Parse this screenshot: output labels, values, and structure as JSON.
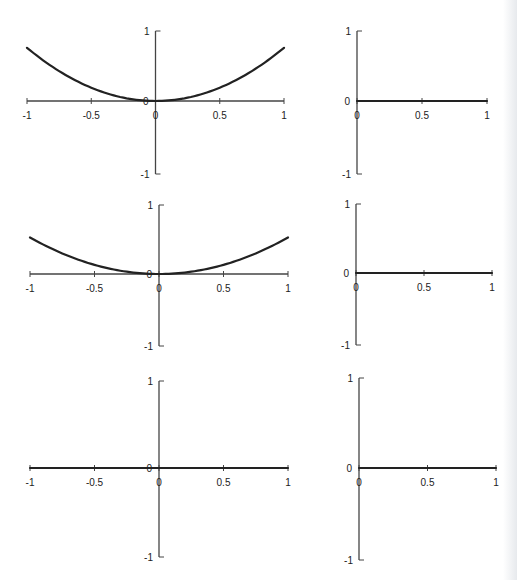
{
  "figure": {
    "layout": "3 rows x 2 columns of small function plots",
    "line_color": "#222222",
    "axis_color": "#444444"
  },
  "chart_data": [
    {
      "type": "line",
      "id": "row1-left",
      "title": "",
      "xlabel": "",
      "ylabel": "",
      "xlim": [
        -1,
        1
      ],
      "ylim": [
        -1,
        1
      ],
      "x_ticks": [
        -1,
        -0.5,
        0,
        0.5,
        1
      ],
      "x_tick_labels": [
        "-1",
        "-0.5",
        "0",
        "0.5",
        "1"
      ],
      "y_ticks": [
        -1,
        0,
        1
      ],
      "y_tick_labels": [
        "-1",
        "0",
        "1"
      ],
      "grid": false,
      "series": [
        {
          "name": "curve",
          "formula": "y = 0.76*x^2",
          "x": [
            -1,
            -0.75,
            -0.5,
            -0.25,
            0,
            0.25,
            0.5,
            0.75,
            1
          ],
          "y": [
            0.76,
            0.43,
            0.19,
            0.05,
            0,
            0.05,
            0.19,
            0.43,
            0.76
          ]
        }
      ]
    },
    {
      "type": "line",
      "id": "row1-right",
      "title": "",
      "xlabel": "",
      "ylabel": "",
      "xlim": [
        0,
        1
      ],
      "ylim": [
        -1,
        1
      ],
      "x_ticks": [
        0,
        0.5,
        1
      ],
      "x_tick_labels": [
        "0",
        "0.5",
        "1"
      ],
      "y_ticks": [
        -1,
        0,
        1
      ],
      "y_tick_labels": [
        "-1",
        "0",
        "1"
      ],
      "grid": false,
      "series": [
        {
          "name": "curve",
          "formula": "y = 0",
          "x": [
            0,
            0.5,
            1
          ],
          "y": [
            0,
            0,
            0
          ]
        }
      ]
    },
    {
      "type": "line",
      "id": "row2-left",
      "title": "",
      "xlabel": "",
      "ylabel": "",
      "xlim": [
        -1,
        1
      ],
      "ylim": [
        -1,
        1
      ],
      "x_ticks": [
        -1,
        -0.5,
        0,
        0.5,
        1
      ],
      "x_tick_labels": [
        "-1",
        "-0.5",
        "0",
        "0.5",
        "1"
      ],
      "y_ticks": [
        -1,
        0,
        1
      ],
      "y_tick_labels": [
        "-1",
        "0",
        "1"
      ],
      "grid": false,
      "series": [
        {
          "name": "curve",
          "formula": "y = 0.53*x^2",
          "x": [
            -1,
            -0.75,
            -0.5,
            -0.25,
            0,
            0.25,
            0.5,
            0.75,
            1
          ],
          "y": [
            0.53,
            0.3,
            0.13,
            0.03,
            0,
            0.03,
            0.13,
            0.3,
            0.53
          ]
        }
      ]
    },
    {
      "type": "line",
      "id": "row2-right",
      "title": "",
      "xlabel": "",
      "ylabel": "",
      "xlim": [
        0,
        1
      ],
      "ylim": [
        -1,
        1
      ],
      "x_ticks": [
        0,
        0.5,
        1
      ],
      "x_tick_labels": [
        "0",
        "0.5",
        "1"
      ],
      "y_ticks": [
        -1,
        0,
        1
      ],
      "y_tick_labels": [
        "-1",
        "0",
        "1"
      ],
      "grid": false,
      "series": [
        {
          "name": "curve",
          "formula": "y = 0",
          "x": [
            0,
            0.5,
            1
          ],
          "y": [
            0,
            0,
            0
          ]
        }
      ]
    },
    {
      "type": "line",
      "id": "row3-left",
      "title": "",
      "xlabel": "",
      "ylabel": "",
      "xlim": [
        -1,
        1
      ],
      "ylim": [
        -1,
        1
      ],
      "x_ticks": [
        -1,
        -0.5,
        0,
        0.5,
        1
      ],
      "x_tick_labels": [
        "-1",
        "-0.5",
        "0",
        "0.5",
        "1"
      ],
      "y_ticks": [
        -1,
        0,
        1
      ],
      "y_tick_labels": [
        "-1",
        "0",
        "1"
      ],
      "grid": false,
      "series": [
        {
          "name": "curve",
          "formula": "y = 0",
          "x": [
            -1,
            -0.5,
            0,
            0.5,
            1
          ],
          "y": [
            0,
            0,
            0,
            0,
            0
          ]
        }
      ]
    },
    {
      "type": "line",
      "id": "row3-right",
      "title": "",
      "xlabel": "",
      "ylabel": "",
      "xlim": [
        0,
        1
      ],
      "ylim": [
        -1,
        1
      ],
      "x_ticks": [
        0,
        0.5,
        1
      ],
      "x_tick_labels": [
        "0",
        "0.5",
        "1"
      ],
      "y_ticks": [
        -1,
        0,
        1
      ],
      "y_tick_labels": [
        "-1",
        "0",
        "1"
      ],
      "grid": false,
      "series": [
        {
          "name": "curve",
          "formula": "y = 0",
          "x": [
            0,
            0.5,
            1
          ],
          "y": [
            0,
            0,
            0
          ]
        }
      ]
    }
  ]
}
